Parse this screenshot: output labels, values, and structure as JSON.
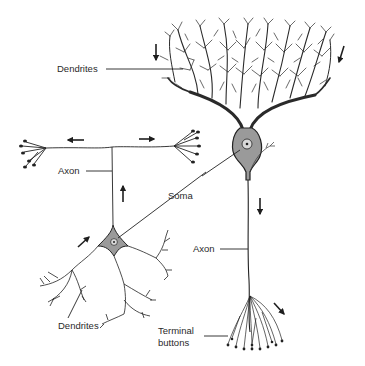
{
  "diagram": {
    "labels": {
      "dendrites_top": "Dendrites",
      "axon_left": "Axon",
      "soma": "Soma",
      "axon_right": "Axon",
      "dendrites_bottom": "Dendrites",
      "terminal_line1": "Terminal",
      "terminal_line2": "buttons"
    },
    "arrows": [
      {
        "id": "top-dendrite-down",
        "direction": "down"
      },
      {
        "id": "top-right-down-left",
        "direction": "down-left"
      },
      {
        "id": "axon-left-branch",
        "direction": "left"
      },
      {
        "id": "axon-right-branch",
        "direction": "right"
      },
      {
        "id": "axon-up",
        "direction": "up"
      },
      {
        "id": "dendrite-up-right",
        "direction": "up-right"
      },
      {
        "id": "right-axon-down",
        "direction": "down"
      },
      {
        "id": "terminal-down-right",
        "direction": "down-right"
      }
    ],
    "colors": {
      "ink": "#1e1e1e",
      "soma_fill": "#9a9a9a",
      "nucleus_fill": "#d8d8d8",
      "background": "#ffffff"
    }
  }
}
